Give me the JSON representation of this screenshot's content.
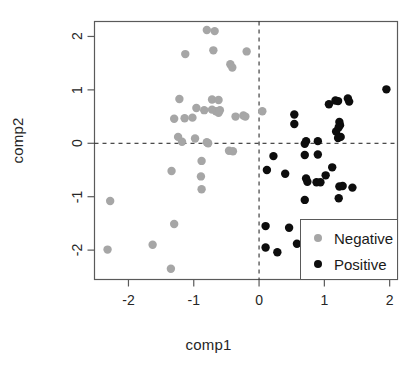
{
  "chart_data": {
    "type": "scatter",
    "title": "",
    "xlabel": "comp1",
    "ylabel": "comp2",
    "xlim": [
      -2.52,
      2.12
    ],
    "ylim": [
      -2.55,
      2.28
    ],
    "xticks": [
      -2,
      -1,
      0,
      1,
      2
    ],
    "xtick_labels": [
      "-2",
      "-1",
      "0",
      "1",
      "2"
    ],
    "yticks": [
      -2,
      -1,
      0,
      1,
      2
    ],
    "ytick_labels": [
      "-2",
      "-1",
      "0",
      "1",
      "2"
    ],
    "grid": false,
    "reference_lines": [
      {
        "axis": "x",
        "value": 0,
        "style": "dashed"
      },
      {
        "axis": "y",
        "value": 0,
        "style": "dashed"
      }
    ],
    "legend_position": "bottom-right",
    "series": [
      {
        "name": "Negative",
        "color": "#a6a6a6",
        "marker": "circle",
        "points": [
          [
            -0.8,
            2.12
          ],
          [
            -0.68,
            2.1
          ],
          [
            -1.13,
            1.67
          ],
          [
            -0.7,
            1.74
          ],
          [
            -0.19,
            1.72
          ],
          [
            -0.44,
            1.48
          ],
          [
            -0.41,
            1.42
          ],
          [
            -1.22,
            0.83
          ],
          [
            -0.72,
            0.82
          ],
          [
            -0.62,
            0.81
          ],
          [
            -0.96,
            0.66
          ],
          [
            -0.84,
            0.62
          ],
          [
            -0.72,
            0.63
          ],
          [
            -0.66,
            0.6
          ],
          [
            -0.62,
            0.57
          ],
          [
            -0.6,
            0.62
          ],
          [
            -0.36,
            0.5
          ],
          [
            -0.24,
            0.52
          ],
          [
            -0.21,
            0.5
          ],
          [
            0.05,
            0.6
          ],
          [
            -1.3,
            0.46
          ],
          [
            -1.14,
            0.47
          ],
          [
            -1.02,
            0.48
          ],
          [
            -1.24,
            0.12
          ],
          [
            -1.18,
            0.03
          ],
          [
            -0.98,
            0.09
          ],
          [
            -0.8,
            0.02
          ],
          [
            -0.78,
            0.0
          ],
          [
            -0.46,
            -0.14
          ],
          [
            -0.4,
            -0.15
          ],
          [
            -0.88,
            -0.33
          ],
          [
            -0.89,
            -0.62
          ],
          [
            -0.88,
            -0.86
          ],
          [
            -1.34,
            -0.52
          ],
          [
            -2.28,
            -1.08
          ],
          [
            -2.32,
            -1.99
          ],
          [
            -1.3,
            -1.51
          ],
          [
            -1.63,
            -1.9
          ],
          [
            -1.35,
            -2.35
          ]
        ]
      },
      {
        "name": "Positive",
        "color": "#0d0d0d",
        "marker": "circle",
        "points": [
          [
            0.54,
            0.54
          ],
          [
            0.54,
            0.36
          ],
          [
            1.07,
            0.73
          ],
          [
            1.17,
            0.8
          ],
          [
            1.21,
            0.79
          ],
          [
            1.36,
            0.84
          ],
          [
            1.38,
            0.78
          ],
          [
            1.95,
            1.01
          ],
          [
            1.18,
            0.22
          ],
          [
            1.23,
            0.4
          ],
          [
            1.24,
            0.34
          ],
          [
            1.22,
            0.3
          ],
          [
            1.25,
            0.12
          ],
          [
            1.21,
            0.1
          ],
          [
            0.72,
            0.04
          ],
          [
            0.7,
            -0.01
          ],
          [
            0.9,
            0.04
          ],
          [
            0.22,
            -0.24
          ],
          [
            0.7,
            -0.22
          ],
          [
            0.9,
            -0.21
          ],
          [
            0.12,
            -0.5
          ],
          [
            0.4,
            -0.57
          ],
          [
            0.72,
            -0.66
          ],
          [
            0.74,
            -0.72
          ],
          [
            0.88,
            -0.73
          ],
          [
            0.94,
            -0.73
          ],
          [
            1.12,
            -0.45
          ],
          [
            1.02,
            -0.6
          ],
          [
            1.23,
            -0.81
          ],
          [
            1.28,
            -0.8
          ],
          [
            1.43,
            -0.83
          ],
          [
            0.7,
            -1.06
          ],
          [
            1.22,
            -1.03
          ],
          [
            0.1,
            -1.55
          ],
          [
            0.46,
            -1.58
          ],
          [
            0.58,
            -1.88
          ],
          [
            0.1,
            -1.95
          ],
          [
            0.28,
            -2.04
          ]
        ]
      }
    ]
  },
  "legend": {
    "items": [
      {
        "label": "Negative",
        "color": "#a6a6a6"
      },
      {
        "label": "Positive",
        "color": "#0d0d0d"
      }
    ]
  }
}
